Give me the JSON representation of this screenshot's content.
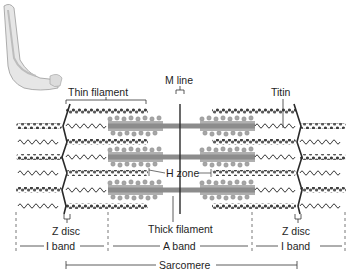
{
  "diagram": {
    "inset": "arm-muscle-icon",
    "labels": {
      "thin_filament": "Thin filament",
      "m_line": "M line",
      "titin": "Titin",
      "h_zone": "H zone",
      "thick_filament": "Thick filament",
      "z_disc_left": "Z disc",
      "z_disc_right": "Z disc",
      "i_band_left": "I band",
      "a_band": "A band",
      "i_band_right": "I band",
      "sarcomere": "Sarcomere"
    },
    "colors": {
      "thin_filament": "#4a4a4a",
      "thick_filament": "#8a8a8a",
      "myosin_heads": "#a8a8a8",
      "z_disc": "#2a2a2a",
      "titin_spring": "#3a3a3a",
      "background": "#ffffff"
    }
  }
}
